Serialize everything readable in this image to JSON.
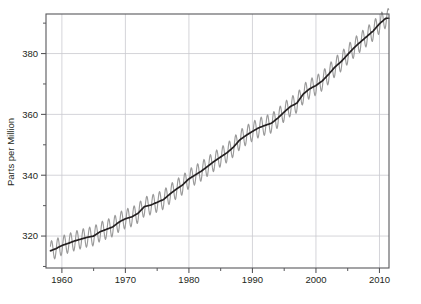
{
  "figure": {
    "title_fragment": "",
    "caption_fragment": ""
  },
  "chart_data": {
    "type": "line",
    "title": "",
    "xlabel": "",
    "ylabel": "Parts per Million",
    "xlim": [
      1957.5,
      2011.5
    ],
    "ylim": [
      309.5,
      393.0
    ],
    "grid": true,
    "legend": null,
    "x_ticks_major": [
      1960,
      1970,
      1980,
      1990,
      2000,
      2010
    ],
    "x_ticks_major_labels": [
      "1960",
      "1970",
      "1980",
      "1990",
      "2000",
      "2010"
    ],
    "x_ticks_minor": [
      1965,
      1975,
      1985,
      1995,
      2005
    ],
    "y_ticks_major": [
      320,
      340,
      360,
      380
    ],
    "y_ticks_major_labels": [
      "320",
      "340",
      "360",
      "380"
    ],
    "y_ticks_minor": [
      310,
      330,
      350,
      370,
      390
    ],
    "colors": {
      "seasonal_series": "#9a9a9a",
      "trend_series": "#231f20",
      "grid": "#c9c9cf",
      "axis": "#58585b",
      "background": "#ffffff"
    },
    "series": [
      {
        "name": "Monthly mean CO2 (seasonal cycle)",
        "color": "#9a9a9a",
        "seasonal_amplitude_ppm": 3.2,
        "note": "Monthly values oscillate about the trend with a ~3.2 ppm peak-to-trough annual cycle, maximum in May, minimum in September."
      },
      {
        "name": "Trend (seasonally adjusted CO2)",
        "color": "#231f20",
        "x": [
          1958,
          1959,
          1960,
          1961,
          1962,
          1963,
          1964,
          1965,
          1966,
          1967,
          1968,
          1969,
          1970,
          1971,
          1972,
          1973,
          1974,
          1975,
          1976,
          1977,
          1978,
          1979,
          1980,
          1981,
          1982,
          1983,
          1984,
          1985,
          1986,
          1987,
          1988,
          1989,
          1990,
          1991,
          1992,
          1993,
          1994,
          1995,
          1996,
          1997,
          1998,
          1999,
          2000,
          2001,
          2002,
          2003,
          2004,
          2005,
          2006,
          2007,
          2008,
          2009,
          2010,
          2011
        ],
        "values": [
          315.0,
          315.8,
          316.9,
          317.6,
          318.4,
          319.0,
          319.6,
          320.0,
          321.4,
          322.2,
          323.0,
          324.6,
          325.7,
          326.3,
          327.5,
          329.7,
          330.2,
          331.1,
          332.0,
          333.8,
          335.4,
          336.8,
          338.8,
          340.1,
          341.4,
          343.0,
          344.6,
          346.0,
          347.4,
          349.2,
          351.6,
          353.1,
          354.4,
          355.6,
          356.4,
          357.1,
          358.8,
          360.8,
          362.6,
          363.7,
          366.7,
          368.4,
          369.5,
          371.0,
          373.2,
          375.6,
          377.4,
          379.7,
          381.9,
          383.8,
          385.6,
          387.4,
          389.8,
          391.6
        ]
      }
    ]
  },
  "axes": {
    "y_axis_title": "Parts per Million",
    "x_tick_labels": [
      "1960",
      "1970",
      "1980",
      "1990",
      "2000",
      "2010"
    ],
    "y_tick_labels": [
      "380",
      "360",
      "340",
      "320"
    ]
  }
}
